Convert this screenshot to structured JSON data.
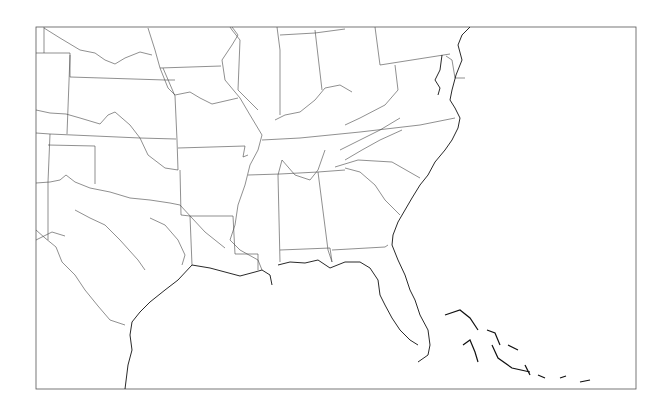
{
  "map": {
    "type": "outline-map",
    "region": "Southeastern United States",
    "frame": {
      "x": 36,
      "y": 27,
      "width": 600,
      "height": 362
    },
    "colors": {
      "background": "#ffffff",
      "lines": "#444444",
      "coast": "#111111",
      "frame": "#555555"
    },
    "labels": []
  }
}
